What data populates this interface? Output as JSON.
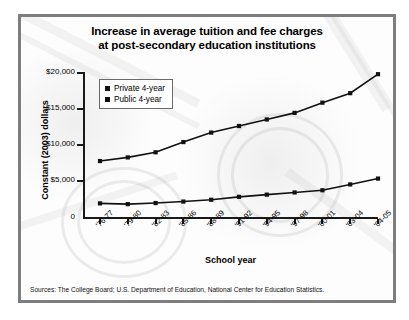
{
  "chart_data": {
    "type": "line",
    "title": "Increase in average tuition and fee charges at post-secondary education institutions",
    "title_line1": "Increase in average tuition and fee charges",
    "title_line2": "at post-secondary education institutions",
    "xlabel": "School year",
    "ylabel": "Constant (2003) dollars",
    "categories": [
      "'76-77",
      "'79-80",
      "'82-83",
      "'85-86",
      "'88-89",
      "'91-92",
      "'94-95",
      "'97-98",
      "'00-01",
      "'03-04",
      "'04-05"
    ],
    "ylim": [
      0,
      20000
    ],
    "ytick_values": [
      20000,
      15000,
      10000,
      5000,
      0
    ],
    "ytick_labels": [
      "$20,000",
      "$15,000",
      "$10,000",
      "$5,000",
      "0"
    ],
    "grid": false,
    "legend_position": "upper-left-inside",
    "series": [
      {
        "name": "Private 4-year",
        "marker": "square",
        "color": "#111111",
        "values": [
          7800,
          8300,
          9000,
          10400,
          11700,
          12600,
          13500,
          14400,
          15800,
          17100,
          19700
        ]
      },
      {
        "name": "Public 4-year",
        "marker": "square",
        "color": "#111111",
        "values": [
          2000,
          1900,
          2050,
          2250,
          2500,
          2900,
          3200,
          3500,
          3800,
          4600,
          5400
        ]
      }
    ],
    "source_note": "Sources: The College Board; U.S. Department of Education, National Center for Education Statistics."
  },
  "legend": {
    "items": [
      {
        "label": "Private 4-year"
      },
      {
        "label": "Public 4-year"
      }
    ]
  },
  "footer": {
    "source": "Sources: The College Board; U.S. Department of Education, National Center for Education Statistics."
  }
}
